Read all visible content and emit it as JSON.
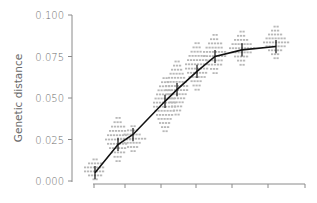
{
  "chart_data": {
    "type": "line",
    "title": "",
    "xlabel": "",
    "ylabel": "Genetic distance",
    "ylim": [
      0.0,
      0.1
    ],
    "y_ticks": [
      "0.000",
      "0.025",
      "0.050",
      "0.075",
      "0.100"
    ],
    "x_tick_count": 7,
    "grid": false,
    "legend": null,
    "series": [
      {
        "name": "mean genetic distance",
        "style": "black line with vertical error bars",
        "points": [
          {
            "x": 1,
            "y": 0.005,
            "err": 0.004
          },
          {
            "x": 2,
            "y": 0.022,
            "err": 0.004
          },
          {
            "x": 3,
            "y": 0.028,
            "err": 0.004
          },
          {
            "x": 4,
            "y": 0.048,
            "err": 0.004
          },
          {
            "x": 5,
            "y": 0.055,
            "err": 0.004
          },
          {
            "x": 6,
            "y": 0.066,
            "err": 0.004
          },
          {
            "x": 7,
            "y": 0.075,
            "err": 0.004
          },
          {
            "x": 8,
            "y": 0.079,
            "err": 0.004
          },
          {
            "x": 9,
            "y": 0.081,
            "err": 0.004
          }
        ]
      },
      {
        "name": "pairwise distances",
        "style": "gray horizontal dash clusters",
        "clusters": [
          {
            "x": 1,
            "y_range": [
              0.001,
              0.013
            ]
          },
          {
            "x": 2,
            "y_range": [
              0.012,
              0.038
            ]
          },
          {
            "x": 3,
            "y_range": [
              0.018,
              0.033
            ]
          },
          {
            "x": 4,
            "y_range": [
              0.03,
              0.062
            ]
          },
          {
            "x": 5,
            "y_range": [
              0.04,
              0.072
            ]
          },
          {
            "x": 6,
            "y_range": [
              0.055,
              0.083
            ]
          },
          {
            "x": 7,
            "y_range": [
              0.065,
              0.088
            ]
          },
          {
            "x": 8,
            "y_range": [
              0.07,
              0.09
            ]
          },
          {
            "x": 9,
            "y_range": [
              0.074,
              0.093
            ]
          }
        ]
      }
    ]
  },
  "axes": {
    "y_title": "Genetic distance",
    "y_ticks": [
      {
        "label": "0.100",
        "value": 0.1
      },
      {
        "label": "0.075",
        "value": 0.075
      },
      {
        "label": "0.050",
        "value": 0.05
      },
      {
        "label": "0.025",
        "value": 0.025
      },
      {
        "label": "0.000",
        "value": 0.0
      }
    ]
  }
}
